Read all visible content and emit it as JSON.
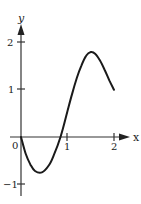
{
  "chart_data": {
    "type": "line",
    "title": "",
    "xlabel": "x",
    "ylabel": "y",
    "xlim": [
      0,
      2.2
    ],
    "ylim": [
      -1.2,
      2.3
    ],
    "grid": false,
    "x_ticks": [
      "1",
      "2"
    ],
    "y_ticks": [
      "2",
      "1",
      "-1"
    ],
    "origin_label": "0",
    "series": [
      {
        "name": "curve",
        "x": [
          0,
          0.1,
          0.2,
          0.3,
          0.45,
          0.6,
          0.7,
          0.85,
          1.0,
          1.1,
          1.2,
          1.3,
          1.4,
          1.5,
          1.6,
          1.7,
          1.8,
          1.9,
          2.0
        ],
        "y": [
          0,
          -0.35,
          -0.58,
          -0.72,
          -0.75,
          -0.6,
          -0.4,
          0.0,
          0.55,
          0.92,
          1.25,
          1.52,
          1.72,
          1.8,
          1.76,
          1.62,
          1.42,
          1.2,
          1.0
        ]
      }
    ]
  },
  "axes": {
    "x_label": "x",
    "y_label": "y",
    "origin": "0",
    "x_tick_1": "1",
    "x_tick_2": "2",
    "y_tick_2": "2",
    "y_tick_1": "1",
    "y_tick_neg1": "−1"
  }
}
